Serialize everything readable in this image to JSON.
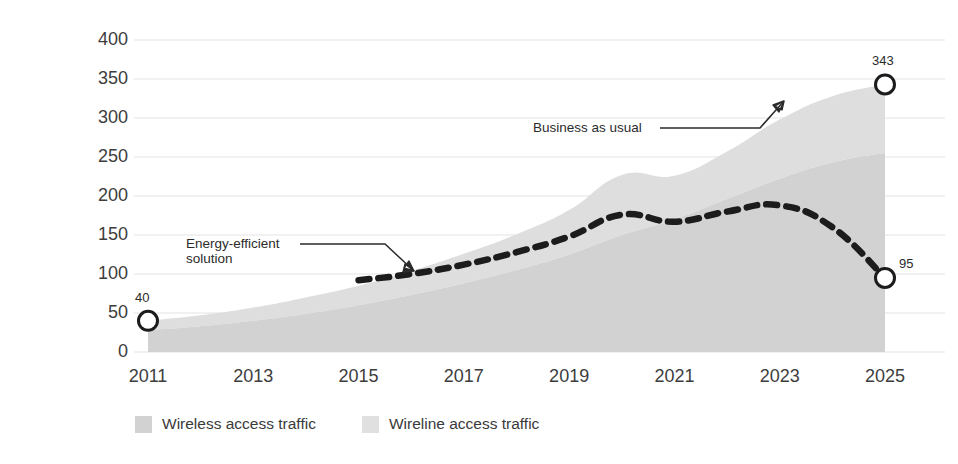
{
  "chart_data": {
    "type": "area",
    "title": "",
    "xlabel": "",
    "ylabel": "Global annual network energy spend ($B)",
    "ylim": [
      0,
      400
    ],
    "xlim": [
      2011,
      2025
    ],
    "grid": true,
    "legend_position": "bottom",
    "yticks": [
      "400",
      "350",
      "300",
      "250",
      "200",
      "150",
      "100",
      "50",
      "0"
    ],
    "ytick_values": [
      400,
      350,
      300,
      250,
      200,
      150,
      100,
      50,
      0
    ],
    "xticks": [
      "2011",
      "2013",
      "2015",
      "2017",
      "2019",
      "2021",
      "2023",
      "2025"
    ],
    "xtick_values": [
      2011,
      2013,
      2015,
      2017,
      2019,
      2021,
      2023,
      2025
    ],
    "x": [
      2011,
      2012,
      2013,
      2014,
      2015,
      2016,
      2017,
      2018,
      2019,
      2020,
      2021,
      2022,
      2023,
      2024,
      2025
    ],
    "series": [
      {
        "name": "Wireless access traffic",
        "color": "#d2d2d2",
        "stacked": true,
        "values": [
          28,
          33,
          40,
          49,
          60,
          73,
          88,
          105,
          125,
          150,
          170,
          196,
          222,
          243,
          255
        ]
      },
      {
        "name": "Wireline access traffic",
        "color": "#dedede",
        "stacked": true,
        "values": [
          12,
          14,
          17,
          21,
          25,
          31,
          38,
          46,
          57,
          77,
          56,
          61,
          76,
          85,
          88
        ]
      }
    ],
    "total_series": {
      "name": "Business as usual",
      "values": [
        40,
        47,
        57,
        70,
        85,
        104,
        126,
        151,
        182,
        227,
        226,
        257,
        298,
        328,
        343
      ]
    },
    "dashed_series": {
      "name": "Energy-efficient solution",
      "color": "#1c1c1c",
      "style": "dashed",
      "x": [
        2015,
        2016,
        2017,
        2018,
        2019,
        2020,
        2021,
        2022,
        2023,
        2024,
        2025
      ],
      "values": [
        92,
        100,
        112,
        128,
        148,
        176,
        167,
        180,
        188,
        160,
        95
      ]
    },
    "markers": [
      {
        "name": "start-marker",
        "x": 2011,
        "value": 40,
        "label": "40",
        "label_position": "above"
      },
      {
        "name": "business-as-usual-end-marker",
        "x": 2025,
        "value": 343,
        "label": "343",
        "label_position": "above"
      },
      {
        "name": "energy-efficient-end-marker",
        "x": 2025,
        "value": 95,
        "label": "95",
        "label_position": "right"
      }
    ],
    "annotations": [
      {
        "name": "business-as-usual",
        "text": "Business as usual",
        "lines": [
          "Business as usual"
        ]
      },
      {
        "name": "energy-efficient-solution",
        "text": "Energy-efficient solution",
        "lines": [
          "Energy-efficient",
          "solution"
        ]
      }
    ]
  },
  "legend": {
    "items": [
      {
        "label": "Wireless access traffic",
        "color": "#d2d2d2"
      },
      {
        "label": "Wireline access traffic",
        "color": "#e0e0e0"
      }
    ]
  },
  "colors": {
    "wireless": "#d2d2d2",
    "wireline": "#dedede",
    "dashed_line": "#1c1c1c",
    "grid": "#ededed",
    "text": "#3d3d3d",
    "marker_stroke": "#1c1c1c"
  }
}
